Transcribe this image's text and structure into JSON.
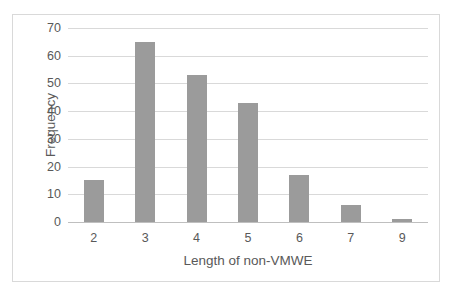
{
  "chart_data": {
    "type": "bar",
    "title": "",
    "subtitle": "",
    "xlabel": "Length of non-VMWE",
    "ylabel": "Frequency",
    "categories": [
      "2",
      "3",
      "4",
      "5",
      "6",
      "7",
      "9"
    ],
    "values": [
      15,
      65,
      53,
      43,
      17,
      6,
      1
    ],
    "series": [
      {
        "name": "Frequency",
        "values": [
          15,
          65,
          53,
          43,
          17,
          6,
          1
        ]
      }
    ],
    "ylim": [
      0,
      70
    ],
    "yticks": [
      0,
      10,
      20,
      30,
      40,
      50,
      60,
      70
    ],
    "ytick_labels": [
      "0",
      "10",
      "20",
      "30",
      "40",
      "50",
      "60",
      "70"
    ],
    "xtick_labels": [
      "2",
      "3",
      "4",
      "5",
      "6",
      "7",
      "9"
    ],
    "grid": "horizontal",
    "legend": "none",
    "annotations": [],
    "colors": {
      "bar": "#9b9b9b",
      "gridline": "#d9d9d9",
      "axis_line": "#bfbfbf",
      "tick_text": "#595959",
      "axis_title_text": "#595959",
      "plot_background": "#ffffff",
      "frame_border": "#d9d9d9"
    }
  }
}
